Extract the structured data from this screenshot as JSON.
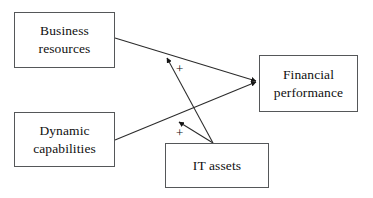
{
  "diagram": {
    "type": "path-model",
    "canvas": {
      "width": 373,
      "height": 198,
      "background": "#ffffff"
    },
    "style": {
      "box_border_color": "#555759",
      "line_color": "#2b2b2b",
      "text_color": "#101010"
    },
    "nodes": [
      {
        "id": "business-resources",
        "label": "Business\nresources",
        "x": 14,
        "y": 12,
        "width": 101,
        "height": 56
      },
      {
        "id": "dynamic-capabilities",
        "label": "Dynamic\ncapabilities",
        "x": 14,
        "y": 112,
        "width": 101,
        "height": 55
      },
      {
        "id": "financial-performance",
        "label": "Financial\nperformance",
        "x": 259,
        "y": 55,
        "width": 99,
        "height": 57
      },
      {
        "id": "it-assets",
        "label": "IT assets",
        "x": 165,
        "y": 143,
        "width": 104,
        "height": 45
      }
    ],
    "edges": [
      {
        "id": "business-resources-to-financial-performance",
        "from": "business-resources",
        "to": "financial-performance",
        "sign": "",
        "arrowhead": true,
        "from_point": [
          115,
          38
        ],
        "to_point": [
          258,
          82
        ]
      },
      {
        "id": "dynamic-capabilities-to-financial-performance",
        "from": "dynamic-capabilities",
        "to": "financial-performance",
        "sign": "",
        "arrowhead": true,
        "from_point": [
          115,
          140
        ],
        "to_point": [
          258,
          82
        ]
      },
      {
        "id": "it-assets-to-business-resources",
        "from": "it-assets",
        "to": "business-resources",
        "sign": "+",
        "arrowhead": true,
        "from_point": [
          213,
          143
        ],
        "to_point": [
          164,
          54
        ]
      },
      {
        "id": "it-assets-to-dynamic-capabilities",
        "from": "it-assets",
        "to": "dynamic-capabilities",
        "sign": "+",
        "arrowhead": true,
        "from_point": [
          213,
          143
        ],
        "to_point": [
          178,
          118
        ]
      }
    ],
    "signs": {
      "upper_plus": "+",
      "lower_plus": "+"
    }
  }
}
